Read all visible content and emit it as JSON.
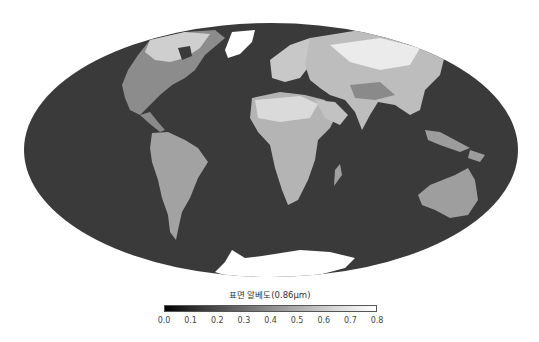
{
  "map": {
    "projection": "Mollweide",
    "ocean_color": "#3a3a3a",
    "land_colors": {
      "low": "#6e6e6e",
      "mid": "#a8a8a8",
      "high": "#f2f2f2"
    },
    "ellipse": {
      "cx": 271,
      "cy": 150,
      "rx": 247,
      "ry": 127
    }
  },
  "colorbar": {
    "title": "표면 알베도(0.86μm)",
    "min": 0.0,
    "max": 0.8,
    "ticks": [
      "0.0",
      "0.1",
      "0.2",
      "0.3",
      "0.4",
      "0.5",
      "0.6",
      "0.7",
      "0.8"
    ],
    "colormap": "grayscale (black to white)"
  }
}
